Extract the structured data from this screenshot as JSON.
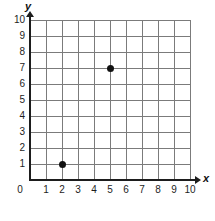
{
  "chart_data": {
    "type": "scatter",
    "title": "",
    "xlabel": "x",
    "ylabel": "y",
    "xlim": [
      0,
      10
    ],
    "ylim": [
      0,
      10
    ],
    "grid": true,
    "legend": false,
    "origin_label": "0",
    "x_ticks": [
      "1",
      "2",
      "3",
      "4",
      "5",
      "6",
      "7",
      "8",
      "9",
      "10"
    ],
    "y_ticks": [
      "1",
      "2",
      "3",
      "4",
      "5",
      "6",
      "7",
      "8",
      "9",
      "10"
    ],
    "points": [
      {
        "x": 2,
        "y": 1,
        "label": "(2, 1)"
      },
      {
        "x": 5,
        "y": 7,
        "label": "(5, 7)"
      }
    ],
    "colors": {
      "point": "#111111",
      "grid": "#7b7b7b",
      "axis": "#1d1d1d",
      "background": "#ffffff"
    }
  }
}
